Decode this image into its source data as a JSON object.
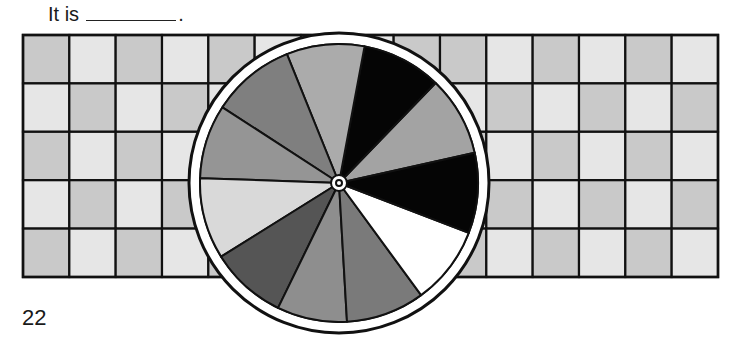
{
  "prompt": {
    "text": "It is",
    "blank_suffix": "."
  },
  "page_number": "22",
  "grid": {
    "rows": 5,
    "columns": 15,
    "colors": {
      "dark": "#c9c9c9",
      "light": "#e6e6e6",
      "line": "#111111"
    },
    "shading": [
      [
        "D",
        "L",
        "D",
        "L",
        "D",
        "L",
        "D",
        "L",
        "D",
        "D",
        "L",
        "D",
        "L",
        "D",
        "L"
      ],
      [
        "L",
        "D",
        "L",
        "D",
        "L",
        "D",
        "L",
        "D",
        "L",
        "L",
        "D",
        "L",
        "D",
        "L",
        "D"
      ],
      [
        "D",
        "L",
        "D",
        "L",
        "D",
        "L",
        "D",
        "L",
        "D",
        "D",
        "L",
        "D",
        "L",
        "D",
        "L"
      ],
      [
        "L",
        "D",
        "L",
        "D",
        "L",
        "D",
        "L",
        "D",
        "L",
        "L",
        "D",
        "L",
        "D",
        "L",
        "D"
      ],
      [
        "D",
        "L",
        "D",
        "L",
        "D",
        "L",
        "D",
        "L",
        "D",
        "D",
        "L",
        "D",
        "L",
        "D",
        "L"
      ]
    ]
  },
  "spinner": {
    "ring_color": "#ffffff",
    "outline_color": "#111111",
    "sections": [
      {
        "name": "section-1",
        "start_deg": 12.6,
        "end_deg": 46,
        "color": "#a3a3a3"
      },
      {
        "name": "section-2",
        "start_deg": 46,
        "end_deg": 79.4,
        "color": "#050505"
      },
      {
        "name": "section-3",
        "start_deg": 79.4,
        "end_deg": 112,
        "color": "#ababab"
      },
      {
        "name": "section-4",
        "start_deg": 112,
        "end_deg": 147,
        "color": "#7f7f7f"
      },
      {
        "name": "section-5",
        "start_deg": 147,
        "end_deg": 178,
        "color": "#959595"
      },
      {
        "name": "section-6",
        "start_deg": 178,
        "end_deg": 212,
        "color": "#d9d9d9"
      },
      {
        "name": "section-7",
        "start_deg": 212,
        "end_deg": 244,
        "color": "#555555"
      },
      {
        "name": "section-8",
        "start_deg": 244,
        "end_deg": 273.3,
        "color": "#8e8e8e"
      },
      {
        "name": "section-9",
        "start_deg": 273.3,
        "end_deg": 306.2,
        "color": "#7a7a7a"
      },
      {
        "name": "section-10",
        "start_deg": 306.2,
        "end_deg": 339,
        "color": "#ffffff"
      },
      {
        "name": "section-11",
        "start_deg": 339,
        "end_deg": 372.6,
        "color": "#050505"
      }
    ]
  }
}
